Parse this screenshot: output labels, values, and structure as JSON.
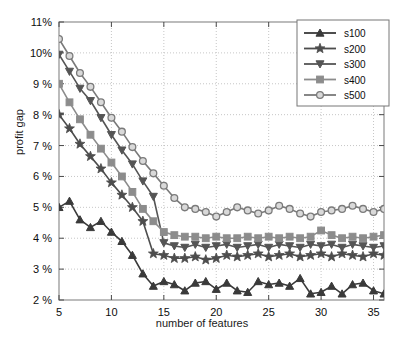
{
  "chart_data": {
    "type": "line",
    "title": "",
    "xlabel": "number of features",
    "ylabel": "profit gap",
    "xlim": [
      5,
      36
    ],
    "ylim": [
      2,
      11
    ],
    "xticks": [
      5,
      10,
      15,
      20,
      25,
      30,
      35
    ],
    "yticks": [
      2,
      3,
      4,
      5,
      6,
      7,
      8,
      9,
      10,
      11
    ],
    "ytick_labels": [
      "2 %",
      "3 %",
      "4 %",
      "5 %",
      "6 %",
      "7 %",
      "8 %",
      "9 %",
      "10%",
      "11%"
    ],
    "xtick_labels": [
      "5",
      "10",
      "15",
      "20",
      "25",
      "30",
      "35"
    ],
    "grid": true,
    "grid_style": "dotted",
    "legend_position": "top-right",
    "x": [
      5,
      6,
      7,
      8,
      9,
      10,
      11,
      12,
      13,
      14,
      15,
      16,
      17,
      18,
      19,
      20,
      21,
      22,
      23,
      24,
      25,
      26,
      27,
      28,
      29,
      30,
      31,
      32,
      33,
      34,
      35,
      36
    ],
    "series": [
      {
        "name": "s100",
        "marker": "triangle-up",
        "color": "#3a3a3a",
        "values": [
          5.0,
          5.2,
          4.6,
          4.35,
          4.55,
          4.2,
          3.9,
          3.45,
          2.85,
          2.45,
          2.6,
          2.5,
          2.3,
          2.55,
          2.6,
          2.35,
          2.55,
          2.3,
          2.25,
          2.6,
          2.5,
          2.55,
          2.45,
          2.7,
          2.2,
          2.25,
          2.45,
          2.2,
          2.5,
          2.55,
          2.3,
          2.2
        ]
      },
      {
        "name": "s200",
        "marker": "star",
        "color": "#4d4d4d",
        "values": [
          8.0,
          7.55,
          7.05,
          6.65,
          6.25,
          5.8,
          5.4,
          5.0,
          4.55,
          3.5,
          3.45,
          3.35,
          3.35,
          3.4,
          3.3,
          3.35,
          3.45,
          3.4,
          3.45,
          3.5,
          3.4,
          3.45,
          3.5,
          3.4,
          3.45,
          3.5,
          3.4,
          3.5,
          3.45,
          3.4,
          3.5,
          3.45
        ]
      },
      {
        "name": "s300",
        "marker": "triangle-down",
        "color": "#555555",
        "values": [
          9.95,
          9.4,
          8.85,
          8.45,
          7.9,
          7.35,
          6.85,
          6.4,
          5.85,
          5.35,
          3.85,
          3.75,
          3.7,
          3.8,
          3.7,
          3.75,
          3.8,
          3.7,
          3.75,
          3.8,
          3.7,
          3.8,
          3.75,
          3.7,
          3.8,
          3.75,
          3.8,
          3.7,
          3.8,
          3.75,
          3.7,
          3.75
        ]
      },
      {
        "name": "s400",
        "marker": "square",
        "color": "#8c8c8c",
        "values": [
          9.0,
          8.4,
          7.85,
          7.35,
          6.9,
          6.45,
          6.0,
          5.5,
          4.95,
          4.55,
          4.2,
          4.1,
          4.05,
          4.05,
          4.0,
          4.05,
          4.0,
          4.0,
          4.05,
          4.0,
          4.05,
          4.0,
          4.05,
          4.0,
          4.05,
          4.25,
          4.1,
          4.0,
          4.05,
          4.0,
          4.05,
          4.1
        ]
      },
      {
        "name": "s500",
        "marker": "circle",
        "color": "#7a7a7a",
        "values": [
          10.45,
          9.9,
          9.35,
          8.9,
          8.4,
          7.9,
          7.45,
          6.95,
          6.5,
          6.1,
          5.7,
          5.3,
          5.0,
          4.95,
          4.85,
          4.7,
          4.85,
          5.0,
          4.9,
          4.8,
          4.9,
          5.05,
          4.95,
          4.8,
          4.7,
          4.85,
          4.9,
          4.95,
          5.05,
          4.95,
          4.85,
          4.95
        ]
      }
    ],
    "legend_entries": [
      {
        "label": "s100",
        "marker": "triangle-up"
      },
      {
        "label": "s200",
        "marker": "star"
      },
      {
        "label": "s300",
        "marker": "triangle-down"
      },
      {
        "label": "s400",
        "marker": "square"
      },
      {
        "label": "s500",
        "marker": "circle"
      }
    ]
  }
}
